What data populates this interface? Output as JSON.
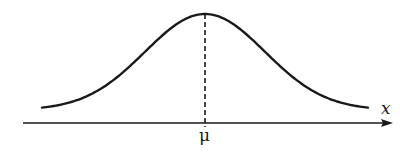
{
  "diagram": {
    "labels": {
      "mean": "μ",
      "axis": "x"
    },
    "colors": {
      "stroke": "#1a1a1a",
      "background": "#ffffff"
    },
    "elements": [
      "bell-shaped curve",
      "dashed vertical line at mean",
      "horizontal x-axis with arrow"
    ]
  }
}
